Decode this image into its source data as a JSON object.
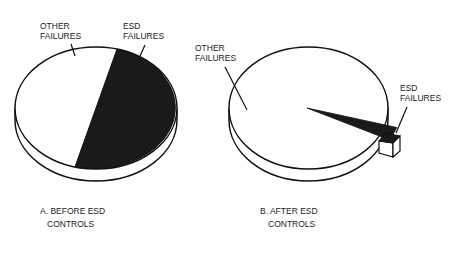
{
  "figure": {
    "panels": [
      {
        "id": "a",
        "caption_line1": "A. BEFORE ESD",
        "caption_line2": "CONTROLS",
        "labels": {
          "other_line1": "OTHER",
          "other_line2": "FAILURES",
          "esd_line1": "ESD",
          "esd_line2": "FAILURES"
        }
      },
      {
        "id": "b",
        "caption_line1": "B. AFTER ESD",
        "caption_line2": "CONTROLS",
        "labels": {
          "other_line1": "OTHER",
          "other_line2": "FAILURES",
          "esd_line1": "ESD",
          "esd_line2": "FAILURES"
        }
      }
    ]
  },
  "chart_data": [
    {
      "type": "pie",
      "title": "A. BEFORE ESD CONTROLS",
      "categories": [
        "OTHER FAILURES",
        "ESD FAILURES"
      ],
      "values": [
        50,
        50
      ],
      "colors": [
        "#ffffff",
        "#1a1a1a"
      ],
      "style": "3d"
    },
    {
      "type": "pie",
      "title": "B. AFTER ESD CONTROLS",
      "categories": [
        "OTHER FAILURES",
        "ESD FAILURES"
      ],
      "values": [
        97.5,
        2.5
      ],
      "colors": [
        "#ffffff",
        "#1a1a1a"
      ],
      "style": "3d-exploded-slice"
    }
  ]
}
